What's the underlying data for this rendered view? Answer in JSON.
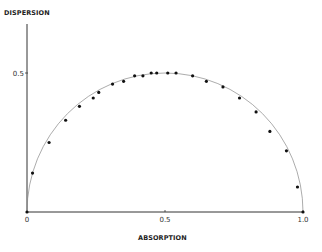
{
  "chart_data": {
    "type": "scatter",
    "title": "",
    "xlabel": "ABSORPTION",
    "ylabel": "DISPERSION",
    "xlim": [
      0,
      1.0
    ],
    "ylim": [
      0,
      0.68
    ],
    "grid": false,
    "legend": null,
    "x_ticks": [
      {
        "value": 0,
        "label": "0"
      },
      {
        "value": 0.5,
        "label": "0.5"
      },
      {
        "value": 1.0,
        "label": "1.0"
      }
    ],
    "y_ticks": [
      {
        "value": 0.5,
        "label": "0.5"
      }
    ],
    "series": [
      {
        "name": "measured points",
        "marker": "dot",
        "color": "#111111",
        "x": [
          0.0,
          0.02,
          0.08,
          0.14,
          0.19,
          0.24,
          0.26,
          0.31,
          0.35,
          0.39,
          0.42,
          0.45,
          0.47,
          0.51,
          0.54,
          0.6,
          0.65,
          0.71,
          0.77,
          0.83,
          0.88,
          0.94,
          0.98,
          1.0
        ],
        "y": [
          0.0,
          0.14,
          0.25,
          0.33,
          0.38,
          0.41,
          0.43,
          0.46,
          0.47,
          0.49,
          0.49,
          0.5,
          0.5,
          0.5,
          0.5,
          0.49,
          0.47,
          0.45,
          0.41,
          0.36,
          0.29,
          0.22,
          0.09,
          0.0
        ]
      },
      {
        "name": "theoretical semicircle",
        "type": "line",
        "color": "#888888",
        "center": [
          0.5,
          0.0
        ],
        "radius": 0.5
      }
    ]
  }
}
